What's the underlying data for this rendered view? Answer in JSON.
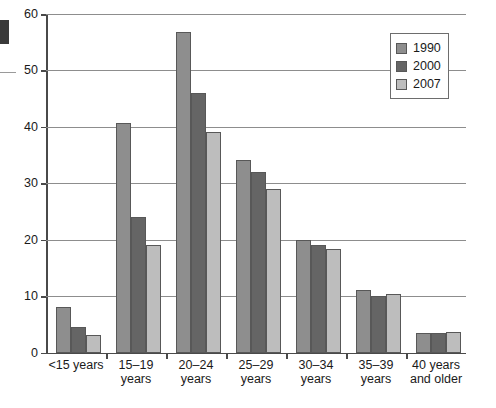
{
  "chart_data": {
    "type": "bar",
    "title": "",
    "subtitle": "",
    "xlabel": "",
    "ylabel": "",
    "ylim": [
      0,
      60
    ],
    "ytick_labels": [
      "0",
      "10",
      "20",
      "30",
      "40",
      "50",
      "60"
    ],
    "ytick_values": [
      0,
      10,
      20,
      30,
      40,
      50,
      60
    ],
    "grid": "horizontal",
    "legend_position": "top-right",
    "categories": [
      "<15 years",
      "15–19\nyears",
      "20–24\nyears",
      "25–29\nyears",
      "30–34\nyears",
      "35–39\nyears",
      "40 years\nand older"
    ],
    "series": [
      {
        "name": "1990",
        "color": "#8e8e8e",
        "values": [
          8.0,
          40.7,
          56.8,
          34.2,
          20.0,
          11.0,
          3.5
        ]
      },
      {
        "name": "2000",
        "color": "#656565",
        "values": [
          4.5,
          24.0,
          46.0,
          32.0,
          19.0,
          10.0,
          3.5
        ]
      },
      {
        "name": "2007",
        "color": "#bdbdbd",
        "values": [
          3.1,
          19.0,
          39.0,
          29.0,
          18.4,
          10.3,
          3.7
        ]
      }
    ]
  },
  "legend": {
    "items": [
      {
        "label": "1990"
      },
      {
        "label": "2000"
      },
      {
        "label": "2007"
      }
    ]
  },
  "axes": {
    "y_max_label": "60",
    "y_min_label": "0"
  }
}
